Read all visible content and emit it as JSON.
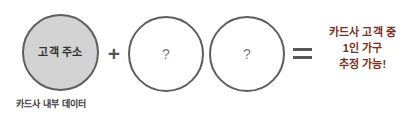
{
  "diagram": {
    "type": "equation-diagram",
    "background_color": "#ffffff",
    "circles": [
      {
        "id": "customer-address",
        "label": "고객 주소",
        "fill_color": "#d3d3d3",
        "border_color": "#5e5e5e",
        "state": "known"
      },
      {
        "id": "unknown-1",
        "label": "?",
        "fill_color": "#ffffff",
        "border_color": "#5e5e5e",
        "state": "unknown"
      },
      {
        "id": "unknown-2",
        "label": "?",
        "fill_color": "#ffffff",
        "border_color": "#5e5e5e",
        "state": "unknown"
      }
    ],
    "operators": {
      "plus": "+",
      "equals": "="
    },
    "result": {
      "color": "#7b2f1e",
      "lines": [
        "카드사 고객 중",
        "1인 가구",
        "추정 가능!"
      ]
    },
    "caption": {
      "text": "카드사 내부 데이터",
      "color": "#3a3a3a"
    }
  }
}
